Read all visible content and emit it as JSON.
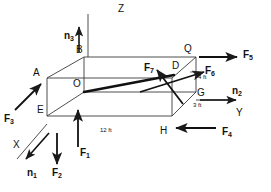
{
  "figure": {
    "type": "free-body-diagram",
    "stroke_color": "#1a1a1a",
    "background_color": "#ffffff"
  },
  "axes": [
    {
      "name": "z-axis",
      "label": "Z",
      "x": 118,
      "y": 4
    },
    {
      "name": "y-axis",
      "label": "Y",
      "x": 236,
      "y": 114
    },
    {
      "name": "x-axis",
      "label": "X",
      "x": 13,
      "y": 146
    }
  ],
  "unit_vectors": [
    {
      "name": "n1",
      "base": "n",
      "sub": "1",
      "x": 31,
      "y": 170
    },
    {
      "name": "n2",
      "base": "n",
      "sub": "2",
      "x": 234,
      "y": 93
    },
    {
      "name": "n3",
      "base": "n",
      "sub": "3",
      "x": 78,
      "y": 33
    }
  ],
  "forces": [
    {
      "name": "F1",
      "base": "F",
      "sub": "1",
      "x": 81,
      "y": 151
    },
    {
      "name": "F2",
      "base": "F",
      "sub": "2",
      "x": 54,
      "y": 170
    },
    {
      "name": "F3",
      "base": "F",
      "sub": "3",
      "x": 8,
      "y": 115
    },
    {
      "name": "F4",
      "base": "F",
      "sub": "4",
      "x": 223,
      "y": 133
    },
    {
      "name": "F5",
      "base": "F",
      "sub": "5",
      "x": 242,
      "y": 57
    },
    {
      "name": "F6",
      "base": "F",
      "sub": "6",
      "x": 208,
      "y": 69
    },
    {
      "name": "F7",
      "base": "F",
      "sub": "7",
      "x": 147,
      "y": 66
    }
  ],
  "vertices": [
    {
      "name": "A",
      "label": "A",
      "x": 35,
      "y": 72
    },
    {
      "name": "B",
      "label": "B",
      "x": 76,
      "y": 47
    },
    {
      "name": "D",
      "label": "D",
      "x": 173,
      "y": 64
    },
    {
      "name": "E",
      "label": "E",
      "x": 39,
      "y": 107
    },
    {
      "name": "G",
      "label": "G",
      "x": 196,
      "y": 91
    },
    {
      "name": "H",
      "label": "H",
      "x": 161,
      "y": 129
    },
    {
      "name": "O",
      "label": "O",
      "x": 74,
      "y": 81
    },
    {
      "name": "Q",
      "label": "Q",
      "x": 185,
      "y": 45
    }
  ],
  "dimensions": [
    {
      "name": "length-12ft",
      "label": "12 ft",
      "x": 101,
      "y": 130
    },
    {
      "name": "height-4ft",
      "label": "4 ft",
      "x": 199,
      "y": 78
    },
    {
      "name": "depth-3ft",
      "label": "3 ft",
      "x": 194,
      "y": 105
    }
  ]
}
